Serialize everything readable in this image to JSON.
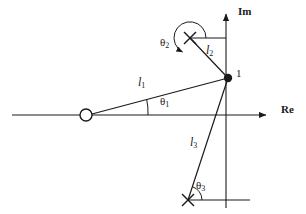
{
  "figure": {
    "kind": "pole-zero-plot",
    "background": "#ffffff",
    "stroke": "#1a1a1a",
    "width": 306,
    "height": 214
  },
  "axes": {
    "real": {
      "label": "Re",
      "label_x": 283,
      "label_y": 110,
      "y": 115,
      "x_start": 12,
      "x_end": 268,
      "arrow": true
    },
    "imaginary": {
      "label": "Im",
      "label_x": 238,
      "label_y": 8,
      "x": 226,
      "y_start": 12,
      "y_end": 208,
      "arrow": true
    },
    "origin": {
      "x": 226,
      "y": 115
    }
  },
  "markers": [
    {
      "name": "zero-open-circle",
      "symbol": "o",
      "x": 86,
      "y": 115,
      "radius": 6,
      "filled": false
    },
    {
      "name": "pole-upper-cross",
      "symbol": "x",
      "x": 190,
      "y": 38,
      "size": 6
    },
    {
      "name": "pole-lower-cross",
      "symbol": "x",
      "x": 188,
      "y": 200,
      "size": 6
    },
    {
      "name": "evaluation-point",
      "symbol": "dot",
      "x": 228,
      "y": 78,
      "radius": 4,
      "filled": true,
      "label": "1",
      "label_x": 236,
      "label_y": 70
    }
  ],
  "vectors": [
    {
      "name": "l1",
      "label": "l",
      "sub": "1",
      "from_x": 86,
      "from_y": 115,
      "to_x": 228,
      "to_y": 78,
      "label_x": 141,
      "label_y": 84
    },
    {
      "name": "l2",
      "label": "l",
      "sub": "2",
      "from_x": 190,
      "from_y": 38,
      "to_x": 228,
      "to_y": 78,
      "label_x": 208,
      "label_y": 52
    },
    {
      "name": "l3",
      "label": "l",
      "sub": "3",
      "from_x": 188,
      "from_y": 200,
      "to_x": 228,
      "to_y": 78,
      "label_x": 192,
      "label_y": 143
    }
  ],
  "angles": [
    {
      "name": "theta1",
      "label": "θ",
      "sub": "1",
      "label_x": 166,
      "label_y": 101,
      "vertex_x": 86,
      "vertex_y": 115,
      "radius": 62
    },
    {
      "name": "theta2",
      "label": "θ",
      "sub": "2",
      "label_x": 168,
      "label_y": 38,
      "vertex_x": 190,
      "vertex_y": 38,
      "radius": 16
    },
    {
      "name": "theta3",
      "label": "θ",
      "sub": "3",
      "label_x": 198,
      "label_y": 184,
      "vertex_x": 188,
      "vertex_y": 200,
      "radius": 14
    }
  ],
  "reference_lines": [
    {
      "name": "upper-pole-horizontal-reference",
      "x1": 190,
      "y1": 38,
      "x2": 226,
      "y2": 38
    },
    {
      "name": "lower-pole-horizontal-reference",
      "x1": 188,
      "y1": 200,
      "x2": 248,
      "y2": 200
    }
  ]
}
